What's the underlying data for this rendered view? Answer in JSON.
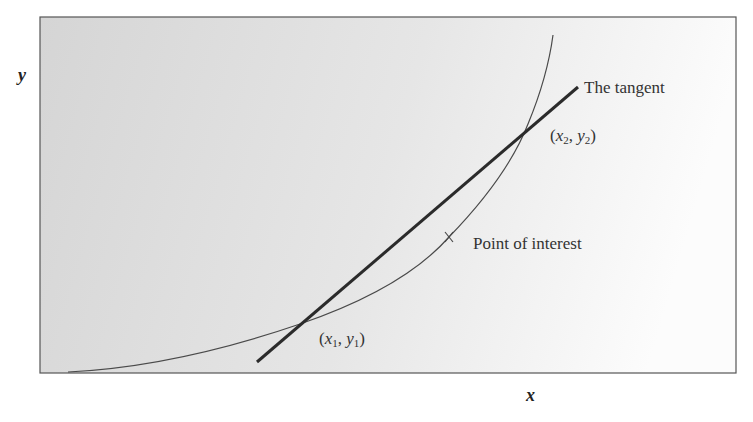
{
  "diagram": {
    "axes": {
      "x_label": "x",
      "y_label": "y"
    },
    "labels": {
      "tangent": "The tangent",
      "point_of_interest": "Point of interest",
      "point1": {
        "x": "x",
        "x_sub": "1",
        "y": "y",
        "y_sub": "1"
      },
      "point2": {
        "x": "x",
        "x_sub": "2",
        "y": "y",
        "y_sub": "2"
      }
    },
    "colors": {
      "background_left": "#d6d6d6",
      "background_right": "#fbfbfb",
      "border": "#555555",
      "curve": "#4a4a4a",
      "tangent": "#2b2b2b"
    }
  }
}
